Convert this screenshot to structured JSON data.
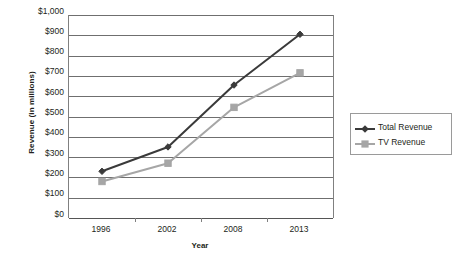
{
  "chart_data": {
    "type": "line",
    "title": "",
    "xlabel": "Year",
    "ylabel": "Revenue (in millions)",
    "categories": [
      "1996",
      "2002",
      "2008",
      "2013"
    ],
    "series": [
      {
        "name": "Total Revenue",
        "color": "#3a3a3a",
        "marker": "diamond",
        "values": [
          230,
          350,
          655,
          905
        ]
      },
      {
        "name": "TV Revenue",
        "color": "#a6a6a6",
        "marker": "square",
        "values": [
          180,
          270,
          545,
          715
        ]
      }
    ],
    "ylim": [
      0,
      1000
    ],
    "ytick_values": [
      0,
      100,
      200,
      300,
      400,
      500,
      600,
      700,
      800,
      900,
      1000
    ],
    "ytick_labels": [
      "$0",
      "$100",
      "$200",
      "$300",
      "$400",
      "$500",
      "$600",
      "$700",
      "$800",
      "$900",
      "$1,000"
    ],
    "grid": "horizontal",
    "legend_position": "right",
    "plot_border": "left-right",
    "background": "#ffffff"
  },
  "legend": {
    "entries": [
      {
        "label": "Total Revenue"
      },
      {
        "label": "TV Revenue"
      }
    ]
  },
  "axes": {
    "x_title": "Year",
    "y_title": "Revenue (in millions)"
  }
}
